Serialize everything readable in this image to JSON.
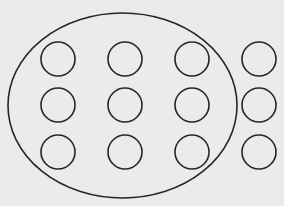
{
  "diagram": {
    "background": "#ebebeb",
    "stroke_color": "#262626",
    "grouping_ellipse": {
      "cx": 122.5,
      "cy": 105.5,
      "rx": 114.5,
      "ry": 92.5,
      "stroke_width": 1.6,
      "encloses_columns": 3
    },
    "grid": {
      "rows": 3,
      "columns": 4,
      "column_x": [
        58,
        125,
        192,
        259
      ],
      "row_y": [
        59,
        105,
        152
      ],
      "circle_radius": 17,
      "stroke_width": 1.6
    },
    "circles": [
      {
        "row": 0,
        "col": 0,
        "inside_ellipse": true
      },
      {
        "row": 0,
        "col": 1,
        "inside_ellipse": true
      },
      {
        "row": 0,
        "col": 2,
        "inside_ellipse": true
      },
      {
        "row": 0,
        "col": 3,
        "inside_ellipse": false
      },
      {
        "row": 1,
        "col": 0,
        "inside_ellipse": true
      },
      {
        "row": 1,
        "col": 1,
        "inside_ellipse": true
      },
      {
        "row": 1,
        "col": 2,
        "inside_ellipse": true
      },
      {
        "row": 1,
        "col": 3,
        "inside_ellipse": false
      },
      {
        "row": 2,
        "col": 0,
        "inside_ellipse": true
      },
      {
        "row": 2,
        "col": 1,
        "inside_ellipse": true
      },
      {
        "row": 2,
        "col": 2,
        "inside_ellipse": true
      },
      {
        "row": 2,
        "col": 3,
        "inside_ellipse": false
      }
    ],
    "summary": {
      "total_circles": 12,
      "circles_inside_ellipse": 9,
      "circles_outside_ellipse": 3
    }
  }
}
